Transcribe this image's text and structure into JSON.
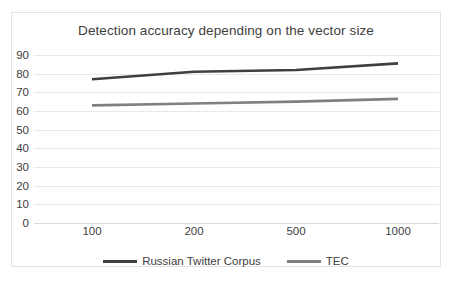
{
  "chart_data": {
    "type": "line",
    "title": "Detection accuracy depending on the vector size",
    "xlabel": "",
    "ylabel": "",
    "categories": [
      "100",
      "200",
      "500",
      "1000"
    ],
    "ylim": [
      0,
      90
    ],
    "yticks": [
      "90",
      "80",
      "70",
      "60",
      "50",
      "40",
      "30",
      "20",
      "10",
      "0"
    ],
    "grid": true,
    "legend_position": "bottom",
    "series": [
      {
        "name": "Russian Twitter Corpus",
        "color": "#3f3f3f",
        "values": [
          77,
          81,
          82,
          85.5
        ]
      },
      {
        "name": "TEC",
        "color": "#808080",
        "values": [
          63,
          64,
          65,
          66.5
        ]
      }
    ]
  }
}
